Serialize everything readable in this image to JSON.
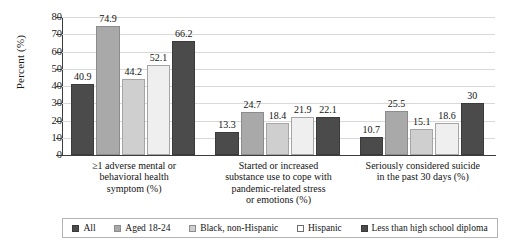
{
  "chart_data": {
    "type": "bar",
    "title": "",
    "xlabel": "",
    "ylabel": "Percent (%)",
    "ylim": [
      0,
      80
    ],
    "yticks": [
      0,
      10,
      20,
      30,
      40,
      50,
      60,
      70,
      80
    ],
    "ytick_labels": [
      "0",
      "10",
      "20",
      "30",
      "40",
      "50",
      "60",
      "70",
      "80"
    ],
    "grid": "horizontal",
    "legend_position": "bottom",
    "categories": [
      "≥1 adverse mental or behavioral health symptom (%)",
      "Started or increased substance use to cope with pandemic-related stress or emotions (%)",
      "Seriously considered suicide in the past 30 days (%)"
    ],
    "category_lines": [
      [
        "≥1 adverse mental or",
        "behavioral health",
        "symptom (%)"
      ],
      [
        "Started or increased",
        "substance use to cope with",
        "pandemic-related stress",
        "or emotions (%)"
      ],
      [
        "Seriously considered suicide",
        "in the past 30 days (%)"
      ]
    ],
    "series": [
      {
        "name": "All",
        "color": "#4b4b4b",
        "values": [
          40.9,
          13.3,
          10.7
        ],
        "labels": [
          "40.9",
          "13.3",
          "10.7"
        ]
      },
      {
        "name": "Aged 18-24",
        "color": "#a9a9a9",
        "values": [
          74.9,
          24.7,
          25.5
        ],
        "labels": [
          "74.9",
          "24.7",
          "25.5"
        ]
      },
      {
        "name": "Black, non-Hispanic",
        "color": "#cfcfcf",
        "values": [
          44.2,
          18.4,
          15.1
        ],
        "labels": [
          "44.2",
          "18.4",
          "15.1"
        ]
      },
      {
        "name": "Hispanic",
        "color": "#efefef",
        "values": [
          52.1,
          21.9,
          18.6
        ],
        "labels": [
          "52.1",
          "21.9",
          "18.6"
        ]
      },
      {
        "name": "Less than high school diploma",
        "color": "#4b4b4b",
        "values": [
          66.2,
          22.1,
          30.0
        ],
        "labels": [
          "66.2",
          "22.1",
          "30"
        ]
      }
    ]
  },
  "legend": {
    "items": [
      {
        "label": "All"
      },
      {
        "label": "Aged 18-24"
      },
      {
        "label": "Black, non-Hispanic"
      },
      {
        "label": "Hispanic"
      },
      {
        "label": "Less than high school diploma"
      }
    ]
  }
}
